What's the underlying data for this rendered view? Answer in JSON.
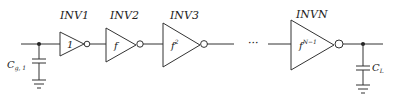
{
  "diagram": {
    "gates": [
      {
        "label": "INV1",
        "gain": "1"
      },
      {
        "label": "INV2",
        "gain": "f"
      },
      {
        "label": "INV3",
        "gain": "f",
        "gain_sup": "2"
      },
      {
        "label": "INVN",
        "gain": "f",
        "gain_sup": "N−1"
      }
    ],
    "ellipsis": "···",
    "input_cap": {
      "label": "C",
      "sub": "g, 1"
    },
    "load_cap": {
      "label": "C",
      "sub": "L"
    }
  }
}
